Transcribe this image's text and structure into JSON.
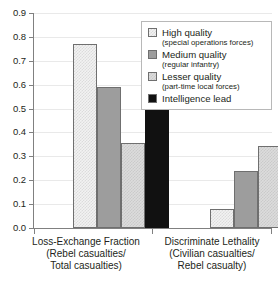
{
  "chart_data": {
    "type": "bar",
    "title": "",
    "subtitle": "",
    "xlabel": "",
    "ylabel": "",
    "ylim": [
      0.0,
      0.9
    ],
    "ytick_labels": [
      "0.9",
      "0.8",
      "0.7",
      "0.6",
      "0.5",
      "0.4",
      "0.3",
      "0.2",
      "0.1",
      "0.0"
    ],
    "ytick_values": [
      0.9,
      0.8,
      0.7,
      0.6,
      0.5,
      0.4,
      0.3,
      0.2,
      0.1,
      0.0
    ],
    "grid": true,
    "legend_position": "top-right",
    "categories": [
      "Loss-Exchange Fraction",
      "Discriminate Lethality"
    ],
    "category_sublabels": [
      [
        "(Rebel casualties/",
        "Total casualties)"
      ],
      [
        "(Civilian casualties/",
        "Rebel casualty)"
      ]
    ],
    "series": [
      {
        "name": "High quality",
        "sub": "(special operations forces)",
        "color": "#f2f2f2",
        "values": [
          0.77,
          0.078
        ]
      },
      {
        "name": "Medium quality",
        "sub": "(regular infantry)",
        "color": "#9d9d9d",
        "values": [
          0.59,
          0.237
        ]
      },
      {
        "name": "Lesser quality",
        "sub": "(part-time local forces)",
        "color": "#dcdcdc",
        "values": [
          0.355,
          0.345
        ]
      },
      {
        "name": "Intelligence lead",
        "sub": "",
        "color": "#111111",
        "values": [
          0.787,
          0.065
        ]
      }
    ]
  },
  "axis": {
    "ticks": [
      {
        "label": "0.9"
      },
      {
        "label": "0.8"
      },
      {
        "label": "0.7"
      },
      {
        "label": "0.6"
      },
      {
        "label": "0.5"
      },
      {
        "label": "0.4"
      },
      {
        "label": "0.3"
      },
      {
        "label": "0.2"
      },
      {
        "label": "0.1"
      },
      {
        "label": "0.0"
      }
    ]
  },
  "categories": [
    {
      "line1": "Loss-Exchange Fraction",
      "line2": "(Rebel casualties/",
      "line3": "Total casualties)"
    },
    {
      "line1": "Discriminate Lethality",
      "line2": "(Civilian casualties/",
      "line3": "Rebel casualty)"
    }
  ],
  "legend": {
    "items": [
      {
        "label": "High quality",
        "sub": "(special operations forces)"
      },
      {
        "label": "Medium quality",
        "sub": "(regular infantry)"
      },
      {
        "label": "Lesser quality",
        "sub": "(part-time local forces)"
      },
      {
        "label": "Intelligence lead",
        "sub": ""
      }
    ]
  }
}
